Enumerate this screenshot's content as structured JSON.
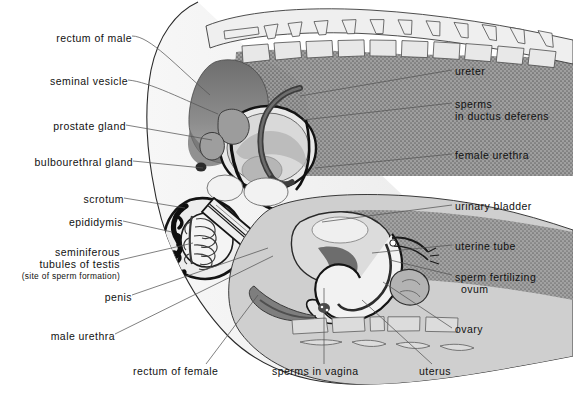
{
  "figure": {
    "palette": {
      "background": "#ffffff",
      "ink": "#111111",
      "leader_line": "#555555",
      "outline": "#1a1a1a",
      "tissue_light": "#ececec",
      "tissue_pale": "#f4f4f4",
      "tissue_mid": "#c9c9c9",
      "tissue_grey": "#a8a8a8",
      "tissue_dark": "#8a8a8a",
      "stipple_dark": "#7b7b7b",
      "bone_fill": "#e4e4e4"
    }
  },
  "labels": {
    "left": [
      {
        "id": "rectum-of-male",
        "text": "rectum  of male",
        "x": 36,
        "y": 38,
        "anchor_x": 210,
        "anchor_y": 95
      },
      {
        "id": "seminal-vesicle",
        "text": "seminal vesicle",
        "x": 34,
        "y": 81,
        "anchor_x": 218,
        "anchor_y": 114
      },
      {
        "id": "prostate-gland",
        "text": "prostate gland",
        "x": 44,
        "y": 127,
        "anchor_x": 212,
        "anchor_y": 140
      },
      {
        "id": "bulbourethral-gland",
        "text": "bulbourethral gland",
        "x": 18,
        "y": 163,
        "anchor_x": 203,
        "anchor_y": 168
      },
      {
        "id": "scrotum",
        "text": "scrotum",
        "x": 86,
        "y": 200,
        "anchor_x": 185,
        "anchor_y": 208
      },
      {
        "id": "epididymis",
        "text": "epididymis",
        "x": 70,
        "y": 222,
        "anchor_x": 172,
        "anchor_y": 232
      },
      {
        "id": "penis",
        "text": "penis",
        "x": 103,
        "y": 297,
        "anchor_x": 268,
        "anchor_y": 248
      },
      {
        "id": "male-urethra",
        "text": "male urethra",
        "x": 56,
        "y": 336,
        "anchor_x": 273,
        "anchor_y": 256
      }
    ],
    "left_multiline": [
      {
        "id": "seminiferous-tubules-of-testis",
        "lines": [
          "seminiferous",
          "tubules of testis"
        ],
        "note": "(site of sperm formation)",
        "x": 25,
        "y": 250,
        "anchor_x": 193,
        "anchor_y": 243
      }
    ],
    "right": [
      {
        "id": "ureter",
        "text": "ureter",
        "x": 455,
        "y": 72,
        "anchor_x": 300,
        "anchor_y": 96
      },
      {
        "id": "female-urethra",
        "text": "female urethra",
        "x": 455,
        "y": 156,
        "anchor_x": 315,
        "anchor_y": 168
      },
      {
        "id": "urinary-bladder",
        "text": "urinary bladder",
        "x": 455,
        "y": 207,
        "anchor_x": 322,
        "anchor_y": 222
      },
      {
        "id": "uterine-tube",
        "text": "uterine tube",
        "x": 455,
        "y": 247,
        "anchor_x": 372,
        "anchor_y": 253
      },
      {
        "id": "ovary",
        "text": "ovary",
        "x": 455,
        "y": 330,
        "anchor_x": 383,
        "anchor_y": 282
      }
    ],
    "right_multiline": [
      {
        "id": "sperms-in-ductus-deferens",
        "lines": [
          "sperms",
          " in ductus deferens"
        ],
        "x": 455,
        "y": 104,
        "anchor_x": 303,
        "anchor_y": 120
      },
      {
        "id": "sperm-fertilizing-ovum",
        "lines": [
          "sperm fertilizing",
          "ovum"
        ],
        "x": 455,
        "y": 277,
        "anchor_x": 390,
        "anchor_y": 260
      }
    ],
    "bottom": [
      {
        "id": "rectum-of-female",
        "text": "rectum of female",
        "x": 133,
        "y": 371,
        "anchor_x": 258,
        "anchor_y": 295
      },
      {
        "id": "sperms-in-vagina",
        "text": "sperms in vagina",
        "x": 272,
        "y": 371,
        "anchor_x": 324,
        "anchor_y": 288
      },
      {
        "id": "uterus",
        "text": "uterus",
        "x": 419,
        "y": 371,
        "anchor_x": 362,
        "anchor_y": 300
      }
    ]
  }
}
